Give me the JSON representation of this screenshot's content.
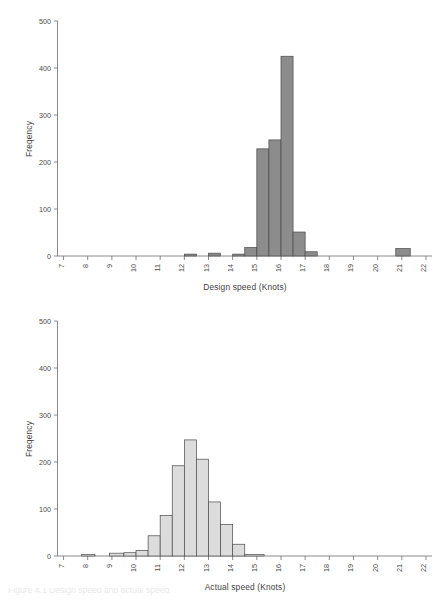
{
  "figure": {
    "caption": "Figure 4.1   Design speed and actual speed",
    "background": "#ffffff"
  },
  "chart_data": [
    {
      "type": "bar",
      "chart_id": "design-speed-histogram",
      "title": "",
      "xlabel": "Design speed (Knots)",
      "ylabel": "Freqency",
      "xlim": [
        6.75,
        22.25
      ],
      "ylim": [
        0,
        500
      ],
      "yticks": [
        0,
        100,
        200,
        300,
        400,
        500
      ],
      "ytick_labels": [
        "0",
        "100",
        "200",
        "300",
        "400",
        "500"
      ],
      "xticks": [
        7,
        8,
        9,
        10,
        11,
        12,
        13,
        14,
        15,
        16,
        17,
        18,
        19,
        20,
        21,
        22
      ],
      "xtick_labels": [
        "7",
        "8",
        "9",
        "10",
        "11",
        "12",
        "13",
        "14",
        "15",
        "16",
        "17",
        "18",
        "19",
        "20",
        "21",
        "22"
      ],
      "xtick_rotation": 90,
      "grid": false,
      "legend": null,
      "bar_color": "#8c8c8c",
      "bar_edge_color": "#4a4a4a",
      "bin_width": 0.5,
      "bins": [
        {
          "x0": 12.0,
          "x1": 12.5,
          "value": 4
        },
        {
          "x0": 13.0,
          "x1": 13.5,
          "value": 6
        },
        {
          "x0": 14.0,
          "x1": 14.5,
          "value": 4
        },
        {
          "x0": 14.5,
          "x1": 15.0,
          "value": 18
        },
        {
          "x0": 15.0,
          "x1": 15.5,
          "value": 228
        },
        {
          "x0": 15.5,
          "x1": 16.0,
          "value": 247
        },
        {
          "x0": 16.0,
          "x1": 16.5,
          "value": 425
        },
        {
          "x0": 16.5,
          "x1": 17.0,
          "value": 51
        },
        {
          "x0": 17.0,
          "x1": 17.5,
          "value": 9
        },
        {
          "x0": 20.75,
          "x1": 21.35,
          "value": 16
        }
      ]
    },
    {
      "type": "bar",
      "chart_id": "actual-speed-histogram",
      "title": "",
      "xlabel": "Actual speed (Knots)",
      "ylabel": "Freqency",
      "xlim": [
        6.75,
        22.25
      ],
      "ylim": [
        0,
        500
      ],
      "yticks": [
        0,
        100,
        200,
        300,
        400,
        500
      ],
      "ytick_labels": [
        "0",
        "100",
        "200",
        "300",
        "400",
        "500"
      ],
      "xticks": [
        7,
        8,
        9,
        10,
        11,
        12,
        13,
        14,
        15,
        16,
        17,
        18,
        19,
        20,
        21,
        22
      ],
      "xtick_labels": [
        "7",
        "8",
        "9",
        "10",
        "11",
        "12",
        "13",
        "14",
        "15",
        "16",
        "17",
        "18",
        "19",
        "20",
        "21",
        "22"
      ],
      "xtick_rotation": 90,
      "grid": false,
      "legend": null,
      "bar_color": "#dcdcdc",
      "bar_edge_color": "#4a4a4a",
      "bin_width": 0.5,
      "bins": [
        {
          "x0": 7.75,
          "x1": 8.3,
          "value": 3
        },
        {
          "x0": 8.9,
          "x1": 9.5,
          "value": 6
        },
        {
          "x0": 9.5,
          "x1": 10.0,
          "value": 7
        },
        {
          "x0": 10.0,
          "x1": 10.5,
          "value": 12
        },
        {
          "x0": 10.5,
          "x1": 11.0,
          "value": 43
        },
        {
          "x0": 11.0,
          "x1": 11.5,
          "value": 86
        },
        {
          "x0": 11.5,
          "x1": 12.0,
          "value": 192
        },
        {
          "x0": 12.0,
          "x1": 12.5,
          "value": 247
        },
        {
          "x0": 12.5,
          "x1": 13.0,
          "value": 206
        },
        {
          "x0": 13.0,
          "x1": 13.5,
          "value": 115
        },
        {
          "x0": 13.5,
          "x1": 14.0,
          "value": 67
        },
        {
          "x0": 14.0,
          "x1": 14.5,
          "value": 25
        },
        {
          "x0": 14.5,
          "x1": 15.3,
          "value": 3
        }
      ]
    }
  ]
}
